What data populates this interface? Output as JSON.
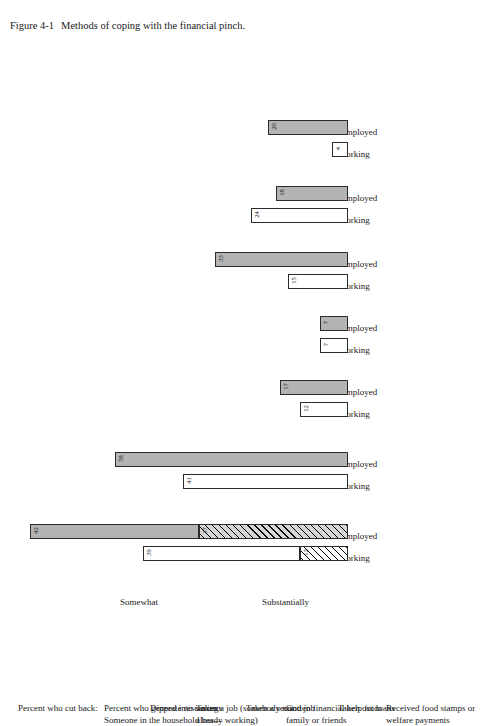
{
  "caption": {
    "figure_number": "Figure 4-1",
    "text": "Methods of coping with the financial pinch."
  },
  "axis_notes": {
    "substantially": "Substantially",
    "somewhat": "Somewhat"
  },
  "series_labels": {
    "working": "Working",
    "unemployed": "Unemployed"
  },
  "categories": [
    {
      "label": "Percent who cut back:"
    },
    {
      "label": "Percent who generate resources:\nSomeone in the household has—"
    },
    {
      "label": "Dipped into savings"
    },
    {
      "label": "Taken a job (somebody not\nalready working)"
    },
    {
      "label": "Taken a second job"
    },
    {
      "label": "Gotten financial help from\nfamily or friends"
    },
    {
      "label": "Taken out loans"
    },
    {
      "label": "Received food stamps or\nwelfare payments"
    }
  ],
  "chart_data": {
    "type": "bar",
    "title": "Methods of coping with the financial pinch.",
    "orientation": "vertical-rotated",
    "xlabel": "",
    "ylabel": "Percent",
    "ylim": [
      0,
      100
    ],
    "grid": false,
    "legend": [
      "Substantially",
      "Somewhat"
    ],
    "legend_position": "axis-annotation",
    "categories": [
      "Percent who cut back:",
      "Dipped into savings",
      "Taken a job (somebody not already working)",
      "Taken a second job",
      "Gotten financial help from family or friends",
      "Taken out loans",
      "Received food stamps or welfare payments"
    ],
    "groups": [
      {
        "category": "Percent who cut back:",
        "stacked": true,
        "bars": [
          {
            "series": "Working",
            "segments": [
              {
                "name": "Substantially",
                "value": 12,
                "style": "hatch"
              },
              {
                "name": "Somewhat",
                "value": 39,
                "style": "white"
              }
            ],
            "total": 51
          },
          {
            "series": "Unemployed",
            "segments": [
              {
                "name": "Substantially",
                "value": 37,
                "style": "hatch-gray"
              },
              {
                "name": "Somewhat",
                "value": 42,
                "style": "gray"
              }
            ],
            "total": 79
          }
        ]
      },
      {
        "category": "Dipped into savings",
        "stacked": false,
        "bars": [
          {
            "series": "Working",
            "segments": [
              {
                "name": "value",
                "value": 41,
                "style": "white"
              }
            ],
            "total": 41
          },
          {
            "series": "Unemployed",
            "segments": [
              {
                "name": "value",
                "value": 58,
                "style": "gray"
              }
            ],
            "total": 58
          }
        ]
      },
      {
        "category": "Taken a job (somebody not already working)",
        "stacked": false,
        "bars": [
          {
            "series": "Working",
            "segments": [
              {
                "name": "value",
                "value": 12,
                "style": "white"
              }
            ],
            "total": 12
          },
          {
            "series": "Unemployed",
            "segments": [
              {
                "name": "value",
                "value": 17,
                "style": "gray"
              }
            ],
            "total": 17
          }
        ]
      },
      {
        "category": "Taken a second job",
        "stacked": false,
        "bars": [
          {
            "series": "Working",
            "segments": [
              {
                "name": "value",
                "value": 7,
                "style": "white"
              }
            ],
            "total": 7
          },
          {
            "series": "Unemployed",
            "segments": [
              {
                "name": "value",
                "value": 7,
                "style": "gray"
              }
            ],
            "total": 7
          }
        ]
      },
      {
        "category": "Gotten financial help from family or friends",
        "stacked": false,
        "bars": [
          {
            "series": "Working",
            "segments": [
              {
                "name": "value",
                "value": 15,
                "style": "white"
              }
            ],
            "total": 15
          },
          {
            "series": "Unemployed",
            "segments": [
              {
                "name": "value",
                "value": 33,
                "style": "gray"
              }
            ],
            "total": 33
          }
        ]
      },
      {
        "category": "Taken out loans",
        "stacked": false,
        "bars": [
          {
            "series": "Working",
            "segments": [
              {
                "name": "value",
                "value": 24,
                "style": "white"
              }
            ],
            "total": 24
          },
          {
            "series": "Unemployed",
            "segments": [
              {
                "name": "value",
                "value": 18,
                "style": "gray"
              }
            ],
            "total": 18
          }
        ]
      },
      {
        "category": "Received food stamps or welfare payments",
        "stacked": false,
        "bars": [
          {
            "series": "Working",
            "segments": [
              {
                "name": "value",
                "value": 4,
                "style": "white"
              }
            ],
            "total": 4
          },
          {
            "series": "Unemployed",
            "segments": [
              {
                "name": "value",
                "value": 20,
                "style": "gray"
              }
            ],
            "total": 20
          }
        ]
      }
    ]
  },
  "colors": {
    "bar_fill_gray": "#b4b4b4",
    "bar_fill_white": "#ffffff",
    "bar_stroke": "#2b2b2b",
    "text": "#1a1a1a",
    "background": "#ffffff"
  }
}
